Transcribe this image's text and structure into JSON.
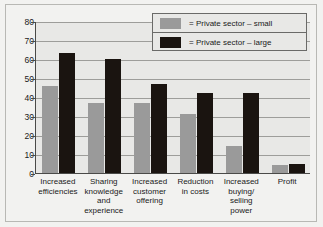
{
  "chart_data": {
    "type": "bar",
    "title": "",
    "subtitle": "",
    "xlabel": "",
    "ylabel": "",
    "ylim": [
      0,
      80
    ],
    "ytick_step": 10,
    "yticks": [
      0,
      10,
      20,
      30,
      40,
      50,
      60,
      70,
      80
    ],
    "grid": true,
    "legend_position": "top-right",
    "categories": [
      "Increased\nefficiencies",
      "Sharing\nknowledge\nand\nexperience",
      "Increased\ncustomer\noffering",
      "Reduction\nin costs",
      "Increased\nbuying/\nselling\npower",
      "Profit"
    ],
    "series": [
      {
        "name": "= Private sector – small",
        "color": "#9a9a9a",
        "values": [
          46,
          37,
          37,
          31,
          14,
          4
        ]
      },
      {
        "name": "= Private sector – large",
        "color": "#1a1410",
        "values": [
          63,
          60,
          47,
          42,
          42,
          5
        ]
      }
    ]
  },
  "axis": {
    "ytick_labels": [
      "80",
      "70",
      "60",
      "50",
      "40",
      "30",
      "20",
      "10",
      "0"
    ]
  },
  "categories_display": [
    {
      "lines": [
        "Increased",
        "efficiencies"
      ]
    },
    {
      "lines": [
        "Sharing",
        "knowledge",
        "and",
        "experience"
      ]
    },
    {
      "lines": [
        "Increased",
        "customer",
        "offering"
      ]
    },
    {
      "lines": [
        "Reduction",
        "in costs"
      ]
    },
    {
      "lines": [
        "Increased",
        "buying/",
        "selling",
        "power"
      ]
    },
    {
      "lines": [
        "Profit"
      ]
    }
  ],
  "legend": {
    "items": [
      {
        "label": "= Private sector – small",
        "swatch": "small"
      },
      {
        "label": "= Private sector – large",
        "swatch": "large"
      }
    ]
  },
  "colors": {
    "series_small": "#9a9a9a",
    "series_large": "#1a1410",
    "plot_background": "#e8e8e6",
    "figure_background": "#f2f2f0",
    "axis": "#4a4a48",
    "gridline": "#9d9d9a"
  }
}
